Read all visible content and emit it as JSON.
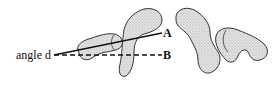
{
  "diagram": {
    "labels": {
      "angle": "angle d",
      "line_a": "A",
      "line_b": "B"
    },
    "colors": {
      "outline": "#333333",
      "fill": "#d9d9d9",
      "line": "#111111"
    },
    "shapes": [
      "blob-1",
      "blob-2",
      "blob-3",
      "blob-4"
    ]
  }
}
